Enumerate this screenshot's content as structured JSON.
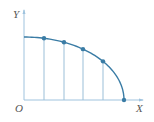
{
  "labels": {
    "y_axis": "Y",
    "x_axis": "X",
    "origin": "O"
  },
  "colors": {
    "curve": "#3a7ca5",
    "axis": "#9fc3de",
    "guide": "#9bbfd8",
    "point": "#3a7ca5"
  },
  "diagram": {
    "origin": [
      24,
      100
    ],
    "x_axis_end": [
      143,
      100
    ],
    "y_axis_top": [
      24,
      10
    ],
    "curve_start": [
      24,
      37
    ],
    "curve_end": [
      124,
      100
    ],
    "points": [
      {
        "x": 44,
        "y": 39
      },
      {
        "x": 64,
        "y": 42
      },
      {
        "x": 83,
        "y": 49
      },
      {
        "x": 103,
        "y": 61
      },
      {
        "x": 124,
        "y": 100
      }
    ]
  }
}
